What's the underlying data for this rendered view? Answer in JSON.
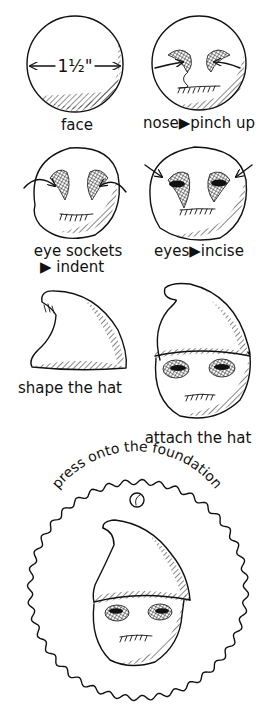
{
  "colors": {
    "ink": "#111111",
    "background": "#ffffff"
  },
  "steps": [
    {
      "id": "face",
      "label": "face",
      "dimension": "1½\""
    },
    {
      "id": "nose",
      "label": "nose▶pinch up"
    },
    {
      "id": "eye-sockets",
      "label_line1": "eye sockets",
      "label_line2": "▶ indent"
    },
    {
      "id": "eyes",
      "label": "eyes▶incise"
    },
    {
      "id": "shape-hat",
      "label": "shape the hat"
    },
    {
      "id": "attach-hat",
      "label": "attach the hat"
    },
    {
      "id": "foundation",
      "label": "press onto the foundation"
    }
  ]
}
